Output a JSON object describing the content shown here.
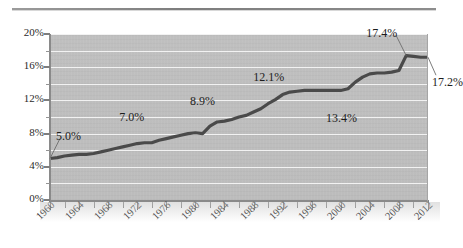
{
  "page": {
    "divider": "horizontal-rule"
  },
  "chart_data": {
    "type": "line",
    "title": "",
    "xlabel": "",
    "ylabel": "",
    "xlim": [
      1960,
      2012
    ],
    "ylim": [
      0,
      20
    ],
    "ytick_labels": [
      "0%",
      "4%",
      "8%",
      "12%",
      "16%",
      "20%"
    ],
    "ytick_values": [
      0,
      4,
      8,
      12,
      16,
      20
    ],
    "yminor_values": [
      2,
      6,
      10,
      14,
      18
    ],
    "grid": true,
    "grid_color": "#f2f2f2",
    "plot_background": "#bfbfbf",
    "line_color": "#4a4a4a",
    "legend": "none",
    "xtick_labels": [
      "1960",
      "1964",
      "1968",
      "1972",
      "1976",
      "1980",
      "1984",
      "1988",
      "1992",
      "1996",
      "2000",
      "2004",
      "2008",
      "2012"
    ],
    "xtick_values": [
      1960,
      1964,
      1968,
      1972,
      1976,
      1980,
      1984,
      1988,
      1992,
      1996,
      2000,
      2004,
      2008,
      2012
    ],
    "x": [
      1960,
      1961,
      1962,
      1963,
      1964,
      1965,
      1966,
      1967,
      1968,
      1969,
      1970,
      1971,
      1972,
      1973,
      1974,
      1975,
      1976,
      1977,
      1978,
      1979,
      1980,
      1981,
      1982,
      1983,
      1984,
      1985,
      1986,
      1987,
      1988,
      1989,
      1990,
      1991,
      1992,
      1993,
      1994,
      1995,
      1996,
      1997,
      1998,
      1999,
      2000,
      2001,
      2002,
      2003,
      2004,
      2005,
      2006,
      2007,
      2008,
      2009,
      2010,
      2011,
      2012
    ],
    "values": [
      5.0,
      5.1,
      5.3,
      5.4,
      5.5,
      5.5,
      5.6,
      5.8,
      6.0,
      6.2,
      6.4,
      6.6,
      6.8,
      6.9,
      6.9,
      7.2,
      7.4,
      7.6,
      7.8,
      8.0,
      8.1,
      8.0,
      8.9,
      9.4,
      9.5,
      9.7,
      10.0,
      10.2,
      10.6,
      11.0,
      11.6,
      12.1,
      12.7,
      13.0,
      13.1,
      13.2,
      13.2,
      13.2,
      13.2,
      13.2,
      13.2,
      13.4,
      14.2,
      14.8,
      15.2,
      15.3,
      15.3,
      15.4,
      15.6,
      17.4,
      17.3,
      17.2,
      17.2
    ],
    "annotations": [
      {
        "label": "5.0%",
        "x": 1960,
        "y": 5.0,
        "leader": true
      },
      {
        "label": "7.0%",
        "x": 1972,
        "y": 6.8,
        "leader": false
      },
      {
        "label": "8.9%",
        "x": 1982,
        "y": 8.9,
        "leader": false
      },
      {
        "label": "12.1%",
        "x": 1991,
        "y": 12.1,
        "leader": false
      },
      {
        "label": "13.4%",
        "x": 2001,
        "y": 13.4,
        "leader": false
      },
      {
        "label": "17.4%",
        "x": 2009,
        "y": 17.4,
        "leader": true
      },
      {
        "label": "17.2%",
        "x": 2012,
        "y": 17.2,
        "leader": true
      }
    ]
  }
}
